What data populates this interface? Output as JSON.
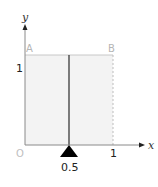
{
  "diagram": {
    "axes": {
      "x_label": "x",
      "y_label": "y",
      "origin_label": "O"
    },
    "points": {
      "A": "A",
      "B": "B"
    },
    "ticks": {
      "x_one": "1",
      "y_one": "1"
    },
    "pivot_label": "0.5",
    "colors": {
      "fill": "#f2f2f2",
      "square_edge": "#c8c8c8",
      "axis": "#333333",
      "middle_line": "#333333",
      "pivot": "#000000",
      "light_label": "#b5b5b5"
    }
  }
}
